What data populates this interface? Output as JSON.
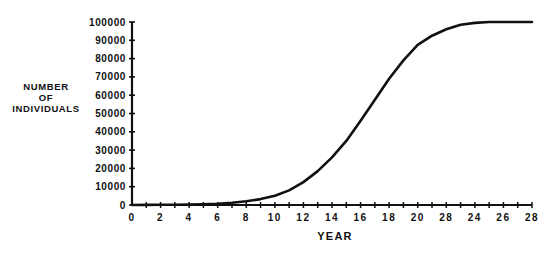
{
  "chart_data": {
    "type": "line",
    "title": "",
    "xlabel": "YEAR",
    "ylabel": "NUMBER OF INDIVIDUALS",
    "ylabel_lines": [
      "NUMBER",
      "OF",
      "INDIVIDUALS"
    ],
    "xlim": [
      0,
      28
    ],
    "ylim": [
      0,
      100000
    ],
    "grid": false,
    "legend": null,
    "x_ticks": [
      0,
      2,
      4,
      6,
      8,
      10,
      12,
      14,
      16,
      18,
      20,
      22,
      24,
      26,
      28
    ],
    "x_tick_labels": [
      "0",
      "2",
      "4",
      "6",
      "8",
      "10",
      "12",
      "14",
      "16",
      "18",
      "20",
      "28",
      "24",
      "26",
      "28"
    ],
    "y_ticks": [
      0,
      10000,
      20000,
      30000,
      40000,
      50000,
      60000,
      70000,
      80000,
      90000,
      100000
    ],
    "y_tick_labels": [
      "0",
      "10000",
      "20000",
      "30000",
      "40000",
      "50000",
      "60000",
      "70000",
      "80000",
      "90000",
      "100000"
    ],
    "series": [
      {
        "name": "population",
        "x": [
          0,
          1,
          2,
          3,
          4,
          5,
          6,
          7,
          8,
          9,
          10,
          11,
          12,
          13,
          14,
          15,
          16,
          17,
          18,
          19,
          20,
          21,
          22,
          23,
          24,
          25,
          26,
          27,
          28
        ],
        "values": [
          0,
          50,
          100,
          150,
          250,
          450,
          700,
          1200,
          2000,
          3200,
          5000,
          8000,
          12500,
          18500,
          26000,
          35000,
          46000,
          57500,
          69000,
          79000,
          87500,
          92500,
          96000,
          98500,
          99500,
          100000,
          100000,
          100000,
          100000
        ]
      }
    ]
  }
}
